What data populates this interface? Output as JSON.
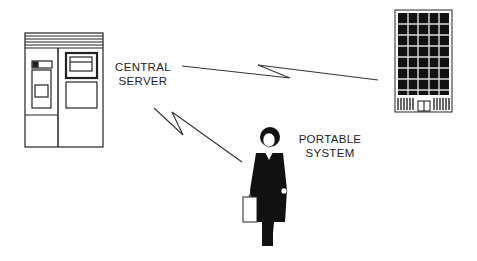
{
  "diagram": {
    "nodes": [
      {
        "id": "server",
        "label_line1": "CENTRAL",
        "label_line2": "SERVER",
        "icon": "server-cabinet-icon"
      },
      {
        "id": "building",
        "label_line1": "",
        "label_line2": "",
        "icon": "office-building-icon"
      },
      {
        "id": "portable",
        "label_line1": "PORTABLE",
        "label_line2": "SYSTEM",
        "icon": "businesswoman-icon"
      }
    ],
    "links": [
      {
        "from": "server",
        "to": "building",
        "style": "lightning-wireless"
      },
      {
        "from": "server",
        "to": "portable",
        "style": "lightning-wireless"
      }
    ],
    "colors": {
      "line": "#333333",
      "fill": "#111111",
      "background": "#ffffff"
    }
  }
}
